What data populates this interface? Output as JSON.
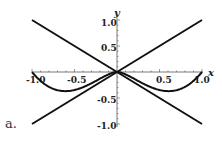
{
  "panel_label": "a.",
  "chart_data": {
    "type": "line",
    "title": "",
    "xlabel": "x",
    "ylabel": "y",
    "xlim": [
      -1,
      1
    ],
    "ylim": [
      -1,
      1
    ],
    "x_ticks": [
      "-1.0",
      "-0.5",
      "0.5",
      "1.0"
    ],
    "y_ticks": [
      "1.0",
      "0.5",
      "-0.5",
      "-1.0"
    ],
    "grid": false,
    "legend": "none",
    "series": [
      {
        "name": "y = x",
        "x": [
          -1,
          0,
          1
        ],
        "y": [
          -1,
          0,
          1
        ]
      },
      {
        "name": "y = -x",
        "x": [
          -1,
          0,
          1
        ],
        "y": [
          1,
          0,
          -1
        ]
      },
      {
        "name": "curve",
        "x": [
          -1,
          -0.8,
          -0.6,
          -0.4,
          -0.2,
          0,
          0.2,
          0.4,
          0.6,
          0.8,
          1
        ],
        "y": [
          0,
          -0.29,
          -0.37,
          -0.29,
          -0.13,
          0,
          -0.13,
          -0.29,
          -0.37,
          -0.29,
          0
        ]
      }
    ]
  }
}
